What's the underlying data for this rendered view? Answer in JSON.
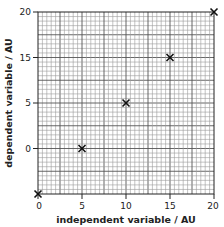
{
  "chart_data": {
    "type": "scatter",
    "title": "",
    "xlabel": "independent variable / AU",
    "ylabel": "dependent variable / AU",
    "x_ticks": [
      0,
      5,
      10,
      15,
      20
    ],
    "y_tick_labels": [
      "",
      "0",
      "5",
      "15",
      "20"
    ],
    "y_tick_note": "y-axis tick labels are unevenly spaced in value (0, 5, 15, 20) at equal visual intervals; bottom gridline unlabeled",
    "xlim": [
      0,
      20
    ],
    "grid": true,
    "grid_minor_per_major": 5,
    "marker": "x",
    "points": [
      {
        "x": 0,
        "y_position": "bottom axis (unlabeled)"
      },
      {
        "x": 5,
        "y_label": "0"
      },
      {
        "x": 10,
        "y_label": "5"
      },
      {
        "x": 15,
        "y_label": "15"
      },
      {
        "x": 20,
        "y_label": "20"
      }
    ],
    "series": [
      {
        "name": "data",
        "x": [
          0,
          5,
          10,
          15,
          20
        ],
        "y_visual_index": [
          0,
          1,
          2,
          3,
          4
        ]
      }
    ]
  },
  "axes": {
    "x_title": "independent variable / AU",
    "y_title": "dependent variable / AU",
    "x_tick_labels": [
      "0",
      "5",
      "10",
      "15",
      "20"
    ],
    "y_tick_labels": [
      "0",
      "5",
      "15",
      "20"
    ]
  },
  "colors": {
    "grid_minor": "#9a9a9a",
    "grid_major": "#555555",
    "axis": "#222222",
    "marker": "#111111"
  }
}
